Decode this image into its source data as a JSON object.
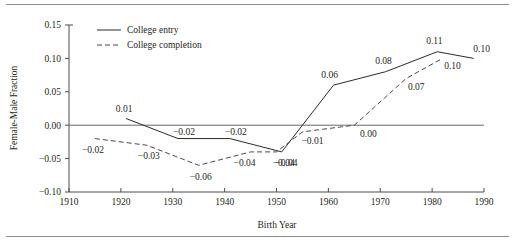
{
  "figure": {
    "top_rule": "horizontal-rule",
    "bottom_rule": "horizontal-rule"
  },
  "chart_data": {
    "type": "line",
    "title": "",
    "xlabel": "Birth Year",
    "ylabel": "Female-Male Fraction",
    "xlim": [
      1910,
      1990
    ],
    "ylim": [
      -0.1,
      0.15
    ],
    "xticks": [
      1910,
      1920,
      1930,
      1940,
      1950,
      1960,
      1970,
      1980,
      1990
    ],
    "xtick_labels": [
      "1910",
      "1920",
      "1930",
      "1940",
      "1950",
      "1960",
      "1970",
      "1980",
      "1990"
    ],
    "yticks": [
      -0.1,
      -0.05,
      0.0,
      0.05,
      0.1,
      0.15
    ],
    "ytick_labels": [
      "−0.10",
      "−0.05",
      "0.00",
      "0.05",
      "0.10",
      "0.15"
    ],
    "grid": false,
    "zero_line": true,
    "legend_position": "top-left",
    "series": [
      {
        "name": "College entry",
        "style": "solid",
        "color": "#2b2b2b",
        "x": [
          1921,
          1931,
          1941,
          1951,
          1961,
          1971,
          1981,
          1988
        ],
        "values": [
          0.01,
          -0.02,
          -0.02,
          -0.04,
          0.06,
          0.08,
          0.11,
          0.1
        ],
        "labels": [
          "0.01",
          "−0.02",
          "−0.02",
          "−0.04",
          "0.06",
          "0.08",
          "0.11",
          "0.10"
        ],
        "label_offsets": [
          {
            "dx": -2,
            "dy": -7
          },
          {
            "dx": 6,
            "dy": -4
          },
          {
            "dx": 6,
            "dy": -4
          },
          {
            "dx": 2,
            "dy": 14
          },
          {
            "dx": -4,
            "dy": -7
          },
          {
            "dx": -2,
            "dy": -8
          },
          {
            "dx": -3,
            "dy": -8
          },
          {
            "dx": 8,
            "dy": -6
          }
        ]
      },
      {
        "name": "College completion",
        "style": "dashed",
        "color": "#4a4a4a",
        "x": [
          1915,
          1925,
          1935,
          1945,
          1950,
          1955,
          1965,
          1975,
          1982
        ],
        "values": [
          -0.02,
          -0.03,
          -0.06,
          -0.04,
          -0.04,
          -0.01,
          0.0,
          0.07,
          0.1
        ],
        "labels": [
          "−0.02",
          "−0.03",
          "−0.06",
          "−0.04",
          "−0.04",
          "−0.01",
          "0.00",
          "0.07",
          "0.10"
        ],
        "label_offsets": [
          {
            "dx": -2,
            "dy": 14
          },
          {
            "dx": 2,
            "dy": 14
          },
          {
            "dx": 2,
            "dy": 15
          },
          {
            "dx": -6,
            "dy": 14
          },
          {
            "dx": 10,
            "dy": 14
          },
          {
            "dx": 10,
            "dy": 12
          },
          {
            "dx": 14,
            "dy": 12
          },
          {
            "dx": 10,
            "dy": 12
          },
          {
            "dx": 10,
            "dy": 11
          }
        ]
      }
    ],
    "legend": [
      {
        "label": "College entry",
        "style": "solid"
      },
      {
        "label": "College completion",
        "style": "dashed"
      }
    ]
  }
}
